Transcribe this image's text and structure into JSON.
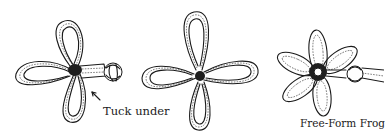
{
  "figure": {
    "panels": [
      {
        "id": "three-loop-frog",
        "caption": "Tuck under",
        "has_arrow": true
      },
      {
        "id": "four-loop-clover",
        "caption": ""
      },
      {
        "id": "six-petal-flower",
        "caption": "Free-Form Frog"
      }
    ],
    "colors": {
      "ink": "#1a1a1a",
      "background": "#ffffff"
    }
  }
}
